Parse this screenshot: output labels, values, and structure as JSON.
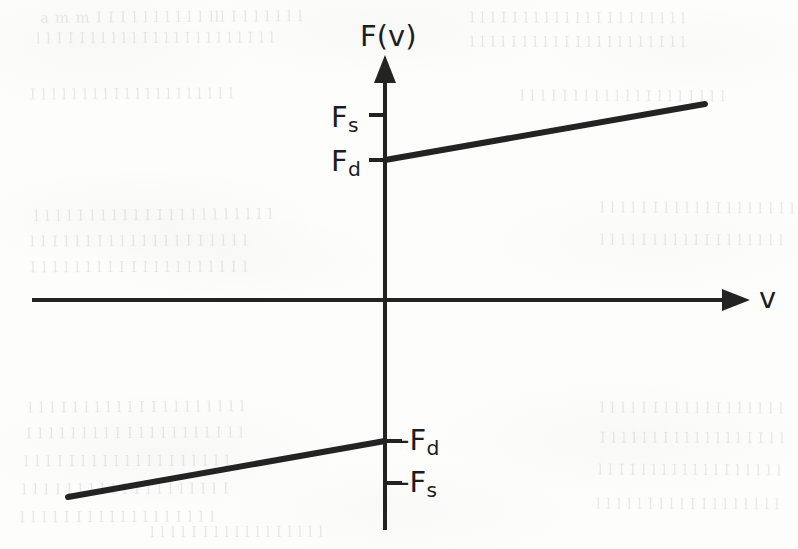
{
  "figure": {
    "kind": "diagram",
    "title_axis_vertical": "F(v)",
    "title_axis_horizontal": "v"
  },
  "axes": {
    "vertical": {
      "label": "F(v)",
      "arrow": "up",
      "origin_x": 385,
      "top_y": 55,
      "bottom_y": 530
    },
    "horizontal": {
      "label": "v",
      "arrow": "right",
      "origin_y": 300,
      "left_x": 32,
      "right_x": 750
    }
  },
  "ticks": [
    {
      "name": "tick-Fs",
      "label": "F",
      "sub": "s",
      "value_y": 115,
      "side": "left"
    },
    {
      "name": "tick-Fd",
      "label": "F",
      "sub": "d",
      "value_y": 160,
      "side": "left"
    },
    {
      "name": "tick-negFd",
      "label": "-F",
      "sub": "d",
      "value_y": 441,
      "side": "right"
    },
    {
      "name": "tick-negFs",
      "label": "-F",
      "sub": "s",
      "value_y": 483,
      "side": "right"
    }
  ],
  "labels": {
    "Fv": "F(v)",
    "v": "v",
    "Fs": "F",
    "Fs_sub": "s",
    "Fd": "F",
    "Fd_sub": "d",
    "negFd": "-F",
    "negFd_sub": "d",
    "negFs": "-F",
    "negFs_sub": "s"
  },
  "chart_data": {
    "type": "line",
    "title": "",
    "xlabel": "v",
    "ylabel": "F(v)",
    "grid": false,
    "legend": null,
    "annotations": [
      "F_s",
      "F_d",
      "-F_d",
      "-F_s"
    ],
    "series": [
      {
        "name": "positive-velocity-branch",
        "comment": "Viscous branch for v > 0, starting at F_d and rising linearly",
        "points_px": [
          [
            385,
            160
          ],
          [
            705,
            104
          ]
        ],
        "start_value": "F_d",
        "slope": "positive"
      },
      {
        "name": "negative-velocity-branch",
        "comment": "Viscous branch for v < 0, ending at -F_d and rising linearly",
        "points_px": [
          [
            68,
            497
          ],
          [
            385,
            441
          ]
        ],
        "end_value": "-F_d",
        "slope": "positive"
      }
    ],
    "discontinuity": {
      "at": "v = 0",
      "from": "-F_s",
      "to": "F_s",
      "comment": "Static friction band between -F_s and F_s at zero velocity"
    }
  },
  "background": {
    "kind": "scanned-page-bleed-through",
    "ghost_lines": [
      {
        "text": "a  m  m   I  I  I l l l  l l l l  lll  I  l l l l  l  l",
        "x": 40,
        "y": 8,
        "size": 15,
        "rot": -0.4
      },
      {
        "text": "l l  I I I  l l l l l   I l l l  I  l l l l l  I  l l",
        "x": 36,
        "y": 30,
        "size": 14,
        "rot": -0.2
      },
      {
        "text": "l l l  I I  l  l l l l   l l  I I  l  l l l l l  l",
        "x": 470,
        "y": 10,
        "size": 14,
        "rot": 0.2
      },
      {
        "text": "l l l  l  I  l l l l   I I l  l  l l l l  l  I l l",
        "x": 470,
        "y": 34,
        "size": 14,
        "rot": 0.1
      },
      {
        "text": "I l l l l   l l l  I l l  l l l   l  l l l l  I",
        "x": 30,
        "y": 86,
        "size": 14,
        "rot": -0.3
      },
      {
        "text": "l l l  I I  l  l l l  l  l l  I l l l  I  l l l",
        "x": 520,
        "y": 88,
        "size": 14,
        "rot": 0.2
      },
      {
        "text": "l  l l l  I l l  l l l  I I  l l l l  l  l l l l  l",
        "x": 34,
        "y": 206,
        "size": 15,
        "rot": -0.5
      },
      {
        "text": "l l  I l l l  I  l l l l  l  l l  I I  l l l l",
        "x": 30,
        "y": 232,
        "size": 15,
        "rot": -0.3
      },
      {
        "text": "I  l l l l  l  l l  I I  l l l l  l  l l l  I l",
        "x": 30,
        "y": 258,
        "size": 15,
        "rot": -0.2
      },
      {
        "text": "l l l  l  I I  l  l l l l  I  l l l  l l  I l",
        "x": 600,
        "y": 200,
        "size": 14,
        "rot": 0.3
      },
      {
        "text": "l  l l l  I  l l l  l l  I I  l l l  l  l l",
        "x": 600,
        "y": 232,
        "size": 14,
        "rot": 0.2
      },
      {
        "text": "l l l  I l l  l  l l l  I I  l l l  l  l l l l",
        "x": 28,
        "y": 398,
        "size": 15,
        "rot": -0.4
      },
      {
        "text": "I l l  l l l l  l  I I  l l l  l l l  l  I l l",
        "x": 26,
        "y": 424,
        "size": 15,
        "rot": -0.3
      },
      {
        "text": "l l  l  I I  l l l l  l  l l l  I  l l l  l l",
        "x": 24,
        "y": 452,
        "size": 15,
        "rot": -0.2
      },
      {
        "text": "l l l  I  l l l  l l  I I  l l l  l  l l l  I",
        "x": 22,
        "y": 480,
        "size": 15,
        "rot": -0.3
      },
      {
        "text": "l  l l l  I I  l l l  l  l l l l  I  l l l",
        "x": 20,
        "y": 508,
        "size": 15,
        "rot": -0.2
      },
      {
        "text": "l l l  l  I I  l l l  l l  I  l l l l  l  l",
        "x": 600,
        "y": 400,
        "size": 14,
        "rot": 0.3
      },
      {
        "text": "I l l  l l l  I  l l l l  l  l l  I I  l l",
        "x": 600,
        "y": 430,
        "size": 14,
        "rot": 0.2
      },
      {
        "text": "l l  I I  l l l  l  l l l l  I  l l l  l l",
        "x": 598,
        "y": 462,
        "size": 14,
        "rot": 0.3
      },
      {
        "text": "l l l l  l  I  l l l  I I  l l l  l  l l l",
        "x": 596,
        "y": 496,
        "size": 14,
        "rot": 0.2
      },
      {
        "text": "l  l l l  I I  l l l  l l l  I  l l l l",
        "x": 150,
        "y": 524,
        "size": 14,
        "rot": -0.2
      }
    ]
  }
}
